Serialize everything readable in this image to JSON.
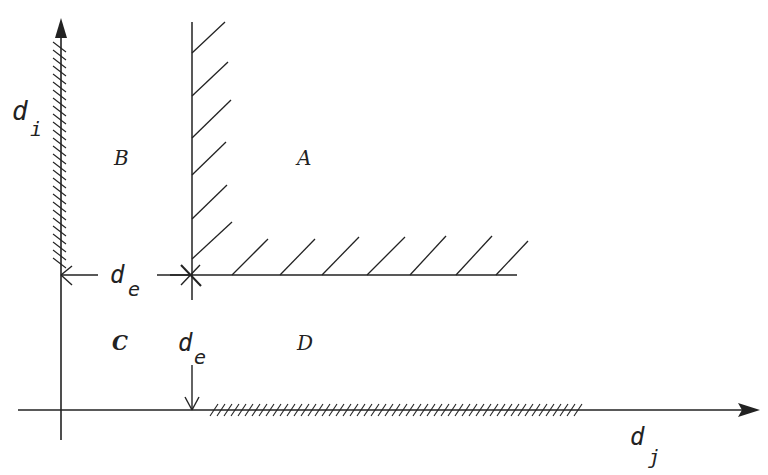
{
  "diagram": {
    "axes": {
      "vertical_label": "d",
      "vertical_subscript": "i",
      "horizontal_label": "d",
      "horizontal_subscript": "j"
    },
    "regions": {
      "A": "A",
      "B": "B",
      "C": "C",
      "D": "D"
    },
    "dimensions": {
      "horizontal_gap_label": "d",
      "horizontal_gap_subscript": "e",
      "vertical_gap_label": "d",
      "vertical_gap_subscript": "e"
    },
    "colors": {
      "stroke": "#222222",
      "background": "#ffffff"
    }
  }
}
